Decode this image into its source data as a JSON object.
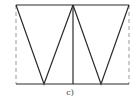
{
  "diagram": {
    "caption": "c)",
    "colors": {
      "stroke": "#2a2a2a",
      "dashed": "#9a9a9a",
      "background": "#ffffff"
    },
    "geometry": {
      "top_y": 5,
      "bottom_y": 84,
      "left_x": 16,
      "right_x": 129,
      "center_x": 73,
      "left_apex_x": 44,
      "right_apex_x": 101
    },
    "elements": [
      {
        "type": "line",
        "name": "top-edge"
      },
      {
        "type": "line",
        "name": "bottom-edge"
      },
      {
        "type": "line",
        "name": "center-vertical"
      },
      {
        "type": "dashed-line",
        "name": "left-dashed-vertical"
      },
      {
        "type": "dashed-line",
        "name": "right-dashed-vertical"
      },
      {
        "type": "triangle",
        "name": "left-inverted-triangle"
      },
      {
        "type": "triangle",
        "name": "right-inverted-triangle"
      }
    ]
  }
}
